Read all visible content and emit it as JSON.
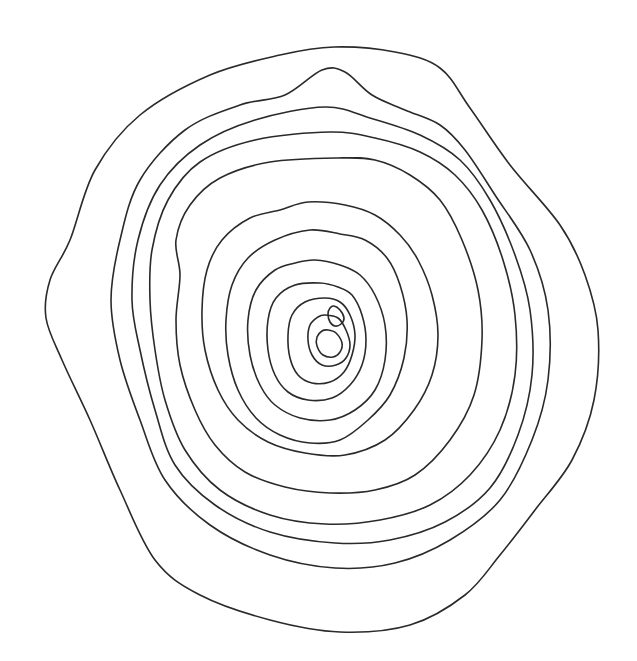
{
  "figure": {
    "type": "concentric-contour-rings",
    "background": "#ffffff",
    "stroke_color": "#2a2a2a",
    "stroke_width": 1.6,
    "ring_count": 15,
    "rings": [
      {
        "id": 1,
        "points": [
          [
            334,
            47
          ],
          [
            395,
            52
          ],
          [
            440,
            68
          ],
          [
            470,
            108
          ],
          [
            510,
            165
          ],
          [
            560,
            225
          ],
          [
            585,
            275
          ],
          [
            598,
            330
          ],
          [
            594,
            400
          ],
          [
            572,
            460
          ],
          [
            535,
            510
          ],
          [
            500,
            555
          ],
          [
            465,
            595
          ],
          [
            410,
            625
          ],
          [
            340,
            632
          ],
          [
            270,
            620
          ],
          [
            200,
            595
          ],
          [
            155,
            560
          ],
          [
            120,
            490
          ],
          [
            90,
            420
          ],
          [
            62,
            360
          ],
          [
            46,
            318
          ],
          [
            50,
            280
          ],
          [
            70,
            240
          ],
          [
            95,
            170
          ],
          [
            140,
            115
          ],
          [
            210,
            75
          ],
          [
            280,
            55
          ]
        ]
      },
      {
        "id": 2,
        "points": [
          [
            322,
            70
          ],
          [
            345,
            72
          ],
          [
            372,
            95
          ],
          [
            405,
            110
          ],
          [
            440,
            125
          ],
          [
            465,
            150
          ],
          [
            495,
            195
          ],
          [
            530,
            250
          ],
          [
            548,
            310
          ],
          [
            548,
            380
          ],
          [
            532,
            440
          ],
          [
            500,
            500
          ],
          [
            450,
            540
          ],
          [
            395,
            563
          ],
          [
            335,
            568
          ],
          [
            270,
            555
          ],
          [
            210,
            525
          ],
          [
            165,
            480
          ],
          [
            140,
            420
          ],
          [
            120,
            360
          ],
          [
            111,
            300
          ],
          [
            120,
            240
          ],
          [
            140,
            180
          ],
          [
            185,
            130
          ],
          [
            240,
            105
          ],
          [
            285,
            95
          ]
        ]
      },
      {
        "id": 3,
        "points": [
          [
            325,
            107
          ],
          [
            370,
            118
          ],
          [
            420,
            135
          ],
          [
            460,
            160
          ],
          [
            490,
            200
          ],
          [
            515,
            255
          ],
          [
            530,
            310
          ],
          [
            532,
            375
          ],
          [
            518,
            435
          ],
          [
            490,
            488
          ],
          [
            445,
            522
          ],
          [
            390,
            540
          ],
          [
            335,
            543
          ],
          [
            270,
            532
          ],
          [
            215,
            505
          ],
          [
            175,
            465
          ],
          [
            155,
            410
          ],
          [
            140,
            350
          ],
          [
            132,
            300
          ],
          [
            138,
            240
          ],
          [
            160,
            185
          ],
          [
            200,
            145
          ],
          [
            255,
            120
          ]
        ]
      },
      {
        "id": 4,
        "points": [
          [
            330,
            132
          ],
          [
            375,
            138
          ],
          [
            420,
            152
          ],
          [
            455,
            175
          ],
          [
            482,
            210
          ],
          [
            503,
            260
          ],
          [
            515,
            315
          ],
          [
            515,
            375
          ],
          [
            500,
            430
          ],
          [
            470,
            475
          ],
          [
            430,
            505
          ],
          [
            380,
            520
          ],
          [
            325,
            524
          ],
          [
            270,
            515
          ],
          [
            220,
            490
          ],
          [
            185,
            450
          ],
          [
            165,
            400
          ],
          [
            155,
            350
          ],
          [
            150,
            300
          ],
          [
            152,
            250
          ],
          [
            168,
            200
          ],
          [
            200,
            162
          ],
          [
            255,
            140
          ]
        ]
      },
      {
        "id": 5,
        "points": [
          [
            338,
            158
          ],
          [
            375,
            160
          ],
          [
            410,
            175
          ],
          [
            440,
            200
          ],
          [
            462,
            240
          ],
          [
            478,
            290
          ],
          [
            482,
            340
          ],
          [
            474,
            395
          ],
          [
            450,
            440
          ],
          [
            415,
            475
          ],
          [
            375,
            490
          ],
          [
            330,
            493
          ],
          [
            285,
            487
          ],
          [
            245,
            472
          ],
          [
            215,
            445
          ],
          [
            195,
            410
          ],
          [
            180,
            365
          ],
          [
            176,
            320
          ],
          [
            180,
            275
          ],
          [
            176,
            240
          ],
          [
            190,
            205
          ],
          [
            220,
            178
          ],
          [
            270,
            162
          ]
        ]
      },
      {
        "id": 6,
        "points": [
          [
            308,
            202
          ],
          [
            345,
            205
          ],
          [
            375,
            215
          ],
          [
            400,
            235
          ],
          [
            418,
            260
          ],
          [
            432,
            295
          ],
          [
            438,
            335
          ],
          [
            432,
            375
          ],
          [
            414,
            410
          ],
          [
            385,
            440
          ],
          [
            345,
            455
          ],
          [
            305,
            453
          ],
          [
            268,
            442
          ],
          [
            238,
            420
          ],
          [
            218,
            390
          ],
          [
            205,
            350
          ],
          [
            202,
            310
          ],
          [
            207,
            270
          ],
          [
            222,
            240
          ],
          [
            250,
            218
          ],
          [
            280,
            210
          ]
        ]
      },
      {
        "id": 7,
        "points": [
          [
            310,
            230
          ],
          [
            340,
            234
          ],
          [
            365,
            240
          ],
          [
            387,
            258
          ],
          [
            400,
            285
          ],
          [
            407,
            320
          ],
          [
            404,
            358
          ],
          [
            390,
            395
          ],
          [
            368,
            420
          ],
          [
            340,
            440
          ],
          [
            310,
            443
          ],
          [
            280,
            435
          ],
          [
            256,
            418
          ],
          [
            238,
            390
          ],
          [
            228,
            355
          ],
          [
            226,
            320
          ],
          [
            232,
            285
          ],
          [
            248,
            258
          ],
          [
            275,
            240
          ]
        ]
      },
      {
        "id": 8,
        "points": [
          [
            315,
            260
          ],
          [
            340,
            265
          ],
          [
            360,
            275
          ],
          [
            375,
            295
          ],
          [
            385,
            325
          ],
          [
            385,
            360
          ],
          [
            375,
            390
          ],
          [
            355,
            410
          ],
          [
            330,
            420
          ],
          [
            300,
            418
          ],
          [
            275,
            405
          ],
          [
            260,
            385
          ],
          [
            250,
            355
          ],
          [
            248,
            320
          ],
          [
            256,
            290
          ],
          [
            275,
            270
          ],
          [
            295,
            263
          ]
        ]
      },
      {
        "id": 9,
        "points": [
          [
            320,
            283
          ],
          [
            338,
            287
          ],
          [
            352,
            295
          ],
          [
            362,
            315
          ],
          [
            366,
            340
          ],
          [
            362,
            365
          ],
          [
            350,
            385
          ],
          [
            332,
            398
          ],
          [
            308,
            400
          ],
          [
            288,
            392
          ],
          [
            275,
            375
          ],
          [
            268,
            350
          ],
          [
            268,
            320
          ],
          [
            276,
            298
          ],
          [
            295,
            285
          ]
        ]
      },
      {
        "id": 10,
        "points": [
          [
            325,
            298
          ],
          [
            340,
            302
          ],
          [
            350,
            315
          ],
          [
            355,
            335
          ],
          [
            352,
            355
          ],
          [
            344,
            372
          ],
          [
            330,
            382
          ],
          [
            312,
            383
          ],
          [
            298,
            375
          ],
          [
            290,
            358
          ],
          [
            288,
            335
          ],
          [
            292,
            315
          ],
          [
            305,
            302
          ]
        ]
      },
      {
        "id": 11,
        "points": [
          [
            325,
            315
          ],
          [
            338,
            318
          ],
          [
            346,
            330
          ],
          [
            350,
            345
          ],
          [
            346,
            358
          ],
          [
            336,
            365
          ],
          [
            322,
            365
          ],
          [
            312,
            355
          ],
          [
            308,
            340
          ],
          [
            310,
            325
          ],
          [
            318,
            317
          ]
        ]
      },
      {
        "id": 12,
        "points": [
          [
            328,
            330
          ],
          [
            336,
            333
          ],
          [
            342,
            343
          ],
          [
            340,
            352
          ],
          [
            333,
            357
          ],
          [
            323,
            355
          ],
          [
            317,
            346
          ],
          [
            317,
            337
          ],
          [
            322,
            331
          ]
        ]
      },
      {
        "id": 13,
        "points": [
          [
            334,
            306
          ],
          [
            340,
            310
          ],
          [
            344,
            318
          ],
          [
            341,
            324
          ],
          [
            335,
            326
          ],
          [
            330,
            322
          ],
          [
            328,
            314
          ],
          [
            330,
            308
          ]
        ]
      }
    ]
  }
}
